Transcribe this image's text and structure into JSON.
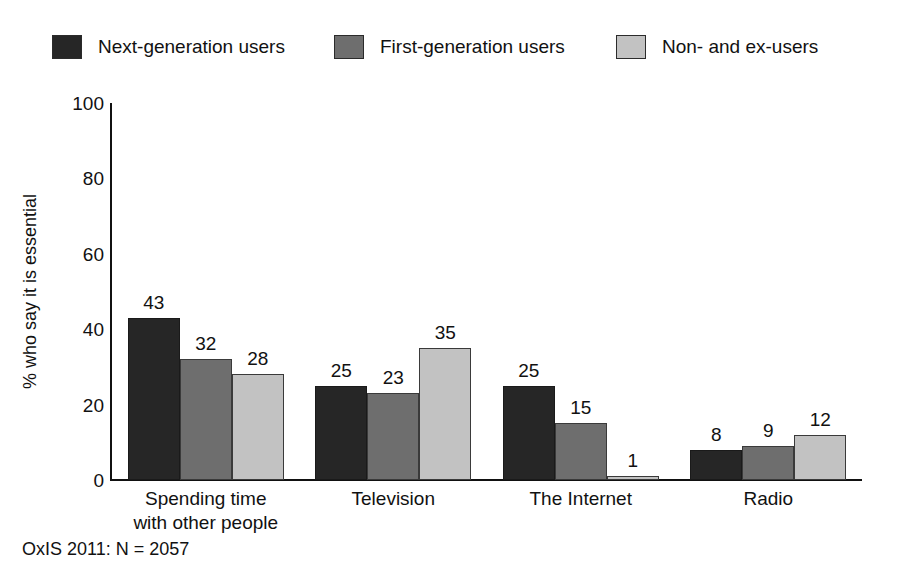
{
  "chart_data": {
    "type": "bar",
    "title": "",
    "subtitle": "",
    "xlabel": "",
    "ylabel": "% who say it is essential",
    "categories": [
      "Spending time with other people",
      "Television",
      "The Internet",
      "Radio"
    ],
    "category_label_lines": [
      [
        "Spending time",
        "with other people"
      ],
      [
        "Television",
        ""
      ],
      [
        "The Internet",
        ""
      ],
      [
        "Radio",
        ""
      ]
    ],
    "series": [
      {
        "name": "Next-generation users",
        "values": [
          43,
          25,
          25,
          8
        ],
        "color": "#262626"
      },
      {
        "name": "First-generation users",
        "values": [
          32,
          23,
          15,
          9
        ],
        "color": "#6e6e6e"
      },
      {
        "name": "Non- and ex-users",
        "values": [
          28,
          35,
          1,
          12
        ],
        "color": "#c2c2c2"
      }
    ],
    "ylim": [
      0,
      100
    ],
    "yticks": [
      100,
      80,
      60,
      40,
      20,
      0
    ],
    "ytick_labels": [
      "100",
      "80",
      "60",
      "40",
      "20",
      "0"
    ],
    "grid": false,
    "legend_position": "top",
    "data_labels": true,
    "note": "OxIS 2011: N = 2057"
  },
  "legend": {
    "items": [
      {
        "label": "Next-generation users",
        "swatch_color": "#262626"
      },
      {
        "label": "First-generation users",
        "swatch_color": "#6e6e6e"
      },
      {
        "label": "Non- and ex-users",
        "swatch_color": "#c2c2c2"
      }
    ]
  },
  "footnote": {
    "text": "OxIS 2011: N = 2057"
  },
  "axis": {
    "y_title": "% who say it is essential",
    "y_tick_labels": [
      "100",
      "80",
      "60",
      "40",
      "20",
      "0"
    ]
  }
}
